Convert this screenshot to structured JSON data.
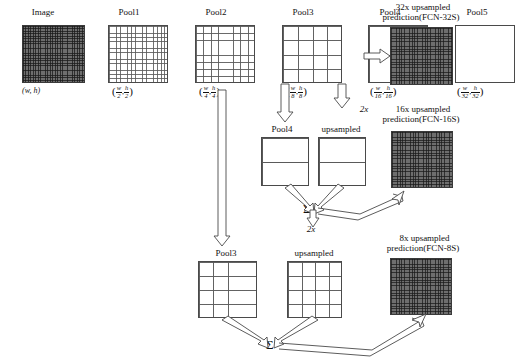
{
  "diagram": {
    "row1": {
      "nodes": [
        {
          "key": "image",
          "label": "Image",
          "size_label": "(w, h)",
          "grid": "fine-dark",
          "x": 22,
          "y": 25,
          "w": 66,
          "h": 60,
          "cells": 26
        },
        {
          "key": "pool1",
          "label": "Pool1",
          "num1": "w",
          "den1": "2",
          "num2": "h",
          "den2": "2",
          "grid": "light",
          "x": 109,
          "y": 25,
          "w": 60,
          "h": 60,
          "cells": 16
        },
        {
          "key": "pool2",
          "label": "Pool2",
          "num1": "w",
          "den1": "4",
          "num2": "h",
          "den2": "4",
          "grid": "light",
          "x": 196,
          "y": 25,
          "w": 59,
          "h": 60,
          "cells": 8
        },
        {
          "key": "pool3",
          "label": "Pool3",
          "num1": "w",
          "den1": "8",
          "num2": "h",
          "den2": "8",
          "grid": "light",
          "x": 283,
          "y": 25,
          "w": 59,
          "h": 60,
          "cells": 4
        },
        {
          "key": "pool4",
          "label": "Pool4",
          "num1": "w",
          "den1": "16",
          "num2": "h",
          "den2": "16",
          "grid": "light",
          "x": 369,
          "y": 25,
          "w": 59,
          "h": 60,
          "cells": 2
        },
        {
          "key": "pool5",
          "label": "Pool5",
          "num1": "w",
          "den1": "32",
          "num2": "h",
          "den2": "32",
          "grid": "light",
          "x": 456,
          "y": 25,
          "w": 59,
          "h": 60,
          "cells": 1
        }
      ],
      "prediction": {
        "label_line1": "32x upsampled",
        "label_line2": "prediction(FCN-32S)",
        "grid": "fine-dark"
      }
    },
    "row2": {
      "pool4_label": "Pool4",
      "upsampled_label": "upsampled",
      "scale_label": "2x",
      "prediction_line1": "16x upsampled",
      "prediction_line2": "prediction(FCN-16S)",
      "sum_symbol": "Σ"
    },
    "row3": {
      "pool3_label": "Pool3",
      "upsampled_label": "upsampled",
      "scale_label": "2x",
      "prediction_line1": "8x upsampled",
      "prediction_line2": "prediction(FCN-8S)",
      "sum_symbol": "Σ"
    },
    "scale_markers": {
      "pool5_2x": "2x",
      "sigma_2x": "2x"
    },
    "colors": {
      "stroke": "#4a4a4a",
      "dark_fill": "#6e6e6e",
      "text": "#111111",
      "background": "#ffffff"
    }
  }
}
